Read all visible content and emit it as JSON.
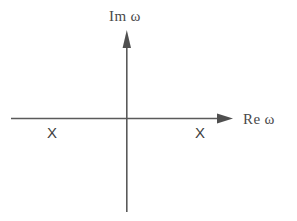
{
  "figure": {
    "background_color": "#ffffff",
    "line_color": "#5a5a5a",
    "text_color": "#4a4a4a",
    "width": 297,
    "height": 221
  },
  "axes": {
    "vertical": {
      "label": "Im ω",
      "icon": "up-arrow-icon",
      "x": 127,
      "y_top": 30,
      "y_bottom": 212,
      "arrow": "up"
    },
    "horizontal": {
      "label": "Re ω",
      "icon": "right-arrow-icon",
      "y": 118,
      "x_left": 11,
      "x_right": 233,
      "arrow": "right"
    },
    "origin": {
      "x": 127,
      "y": 118
    }
  },
  "markers": {
    "symbol": "X",
    "items": [
      {
        "name": "pole-left",
        "label": "X",
        "x": 53,
        "y": 133,
        "side": "negative-real"
      },
      {
        "name": "pole-right",
        "label": "X",
        "x": 201,
        "y": 133,
        "side": "positive-real"
      }
    ]
  }
}
